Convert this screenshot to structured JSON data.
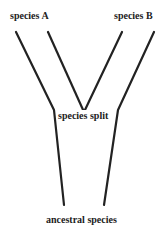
{
  "diagram": {
    "type": "evolutionary-tree",
    "labels": {
      "species_a": "species A",
      "species_b": "species B",
      "split": "species split",
      "ancestor": "ancestral species"
    },
    "line_color": "#222222"
  }
}
